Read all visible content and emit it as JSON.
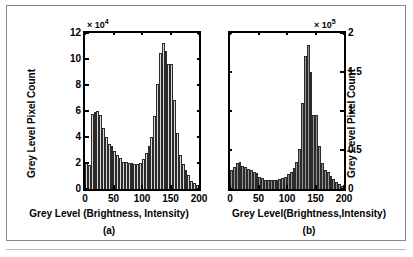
{
  "figure": {
    "background": "#ffffff",
    "frame_color": "#8a8a8a"
  },
  "chart_data": [
    {
      "type": "bar",
      "panel": "a",
      "caption": "(a)",
      "title": "",
      "xlabel": "Grey Level (Brightness, Intensity)",
      "ylabel": "Grey Level Pixel Count",
      "y_exponent_prefix": "× 10",
      "y_exponent_power": "4",
      "bar_fill": "#d9d9d9",
      "bar_edge": "#2b2b2b",
      "xlim": [
        0,
        200
      ],
      "ylim": [
        0,
        12
      ],
      "xticks": [
        0,
        50,
        100,
        150,
        200
      ],
      "xtick_labels": [
        "0",
        "50",
        "100",
        "150",
        "200"
      ],
      "yticks": [
        0,
        2,
        4,
        6,
        8,
        10,
        12
      ],
      "ytick_labels": [
        "0",
        "2",
        "4",
        "6",
        "8",
        "10",
        "12"
      ],
      "y_axis_side": "left",
      "grid": false,
      "legend": false,
      "bin_width": 5,
      "x": [
        0,
        5,
        10,
        15,
        20,
        25,
        30,
        35,
        40,
        45,
        50,
        55,
        60,
        65,
        70,
        75,
        80,
        85,
        90,
        95,
        100,
        105,
        110,
        115,
        120,
        125,
        130,
        135,
        140,
        145,
        150,
        155,
        160,
        165,
        170,
        175,
        180,
        185,
        190,
        195
      ],
      "values": [
        2.0,
        1.85,
        5.75,
        5.95,
        6.0,
        5.7,
        4.7,
        4.0,
        3.45,
        3.3,
        2.9,
        2.65,
        2.35,
        2.1,
        2.05,
        2.0,
        2.0,
        1.95,
        1.95,
        2.0,
        2.3,
        2.8,
        3.3,
        4.0,
        5.6,
        8.1,
        10.45,
        11.2,
        10.65,
        9.6,
        9.6,
        6.85,
        4.3,
        2.6,
        1.95,
        1.5,
        1.05,
        0.65,
        0.45,
        0.3
      ]
    },
    {
      "type": "bar",
      "panel": "b",
      "caption": "(b)",
      "title": "",
      "xlabel": "Grey Level(Brightness,Intensity)",
      "ylabel": "Grey Level Pixel Count",
      "y_exponent_prefix": "× 10",
      "y_exponent_power": "5",
      "bar_fill": "#949494",
      "bar_edge": "#2b2b2b",
      "xlim": [
        0,
        200
      ],
      "ylim": [
        0,
        2
      ],
      "xticks": [
        0,
        50,
        100,
        150,
        200
      ],
      "xtick_labels": [
        "0",
        "50",
        "100",
        "150",
        "200"
      ],
      "yticks": [
        0,
        0.5,
        1,
        1.5,
        2
      ],
      "ytick_labels": [
        "0",
        "0.5",
        "1",
        "1.5",
        "2"
      ],
      "y_axis_side": "right",
      "grid": false,
      "legend": false,
      "bin_width": 5,
      "x": [
        0,
        5,
        10,
        15,
        20,
        25,
        30,
        35,
        40,
        45,
        50,
        55,
        60,
        65,
        70,
        75,
        80,
        85,
        90,
        95,
        100,
        105,
        110,
        115,
        120,
        125,
        130,
        135,
        140,
        145,
        150,
        155,
        160,
        165,
        170,
        175,
        180,
        185,
        190,
        195
      ],
      "values": [
        0.24,
        0.28,
        0.33,
        0.35,
        0.3,
        0.28,
        0.26,
        0.24,
        0.22,
        0.2,
        0.16,
        0.14,
        0.12,
        0.11,
        0.11,
        0.11,
        0.12,
        0.13,
        0.14,
        0.16,
        0.19,
        0.22,
        0.27,
        0.34,
        0.51,
        1.1,
        1.7,
        1.85,
        1.5,
        0.95,
        0.95,
        0.55,
        0.33,
        0.24,
        0.22,
        0.17,
        0.13,
        0.09,
        0.06,
        0.04
      ]
    }
  ]
}
